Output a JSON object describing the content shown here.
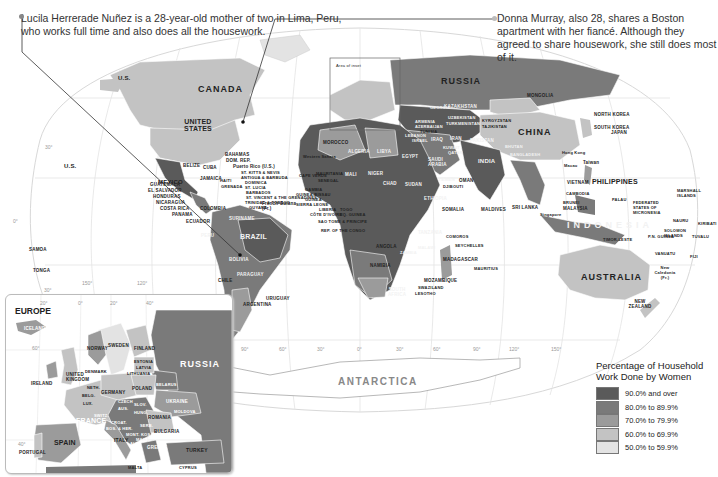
{
  "callouts": {
    "left": "Lucila Herrerade Nuñez is a 28-year-old mother of two in Lima, Peru, who works full time and also does all the housework.",
    "right": "Donna Murray, also 28, shares a Boston apartment with her fiancé. Although they agreed to share housework, she still does most of it."
  },
  "legend": {
    "title": "Percentage of Household Work Done by Women",
    "items": [
      {
        "label": "90.0% and over",
        "color": "#5a5a5a"
      },
      {
        "label": "80.0% to 89.9%",
        "color": "#7a7a7a"
      },
      {
        "label": "70.0% to 79.9%",
        "color": "#9b9b9b"
      },
      {
        "label": "60.0% to 69.9%",
        "color": "#c3c3c3"
      },
      {
        "label": "50.0% to 59.9%",
        "color": "#e3e3e3"
      }
    ]
  },
  "map": {
    "large_labels": {
      "canada": "CANADA",
      "united_states": "UNITED STATES",
      "russia": "RUSSIA",
      "china": "CHINA",
      "brazil": "BRAZIL",
      "australia": "AUSTRALIA",
      "indonesia": "INDONESIA",
      "antarctica": "ANTARCTICA",
      "mexico": "MEXICO",
      "india": "INDIA"
    },
    "small_labels": {
      "us_alaska": "U.S.",
      "us_hawaii": "U.S.",
      "samoa": "SAMOA",
      "tonga": "TONGA",
      "bahamas": "BAHAMAS",
      "dom_rep": "DOM. REP.",
      "puerto_rico": "Puerto Rico (U.S.)",
      "st_kitts": "ST. KITTS & NEVIS",
      "antigua": "ANTIGUA & BARBUDA",
      "dominica": "DOMINICA",
      "st_lucia": "ST. LUCIA",
      "barbados": "BARBADOS",
      "st_vincent": "ST. VINCENT & THE GRENADINES",
      "trinidad": "TRINIDAD & TOBAGO",
      "guyana": "GUYANA",
      "french_guiana": "French Guiana (Fr.)",
      "belize": "BELIZE",
      "cuba": "CUBA",
      "jamaica": "JAMAICA",
      "haiti": "HAITI",
      "grenada": "GRENADA",
      "guatemala": "GUATEMALA",
      "el_salvador": "EL SALVADOR",
      "honduras": "HONDURAS",
      "nicaragua": "NICARAGUA",
      "costa_rica": "COSTA RICA",
      "panama": "PANAMA",
      "colombia": "COLOMBIA",
      "ecuador": "ECUADOR",
      "peru": "PERU",
      "suriname": "SURINAME",
      "bolivia": "BOLIVIA",
      "paraguay": "PARAGUAY",
      "chile": "CHILE",
      "argentina": "ARGENTINA",
      "uruguay": "URUGUAY",
      "morocco": "MOROCCO",
      "western_sahara": "Western Sahara",
      "cape_verde": "CAPE VERDE",
      "mauritania": "MAURITANIA",
      "senegal": "SENEGAL",
      "gambia": "GAMBIA",
      "guinea_bissau": "GUINEA-BISSAU",
      "guinea": "GUINEA",
      "sierra_leone": "SIERRA LEONE",
      "liberia": "LIBERIA",
      "cote_divoire": "CÔTE D'IVOIRE",
      "togo": "TOGO",
      "eq_guinea": "EQ. GUINEA",
      "sao_tome": "SAO TOME & PRINCIPE",
      "rep_congo": "REP. OF THE CONGO",
      "algeria": "ALGERIA",
      "libya": "LIBYA",
      "egypt": "EGYPT",
      "mali": "MALI",
      "niger": "NIGER",
      "chad": "CHAD",
      "sudan": "SUDAN",
      "ethiopia": "ETHIOPIA",
      "djibouti": "DJIBOUTI",
      "somalia": "SOMALIA",
      "tanzania": "TANZANIA",
      "angola": "ANGOLA",
      "zambia": "ZAMBIA",
      "malawi": "MALAWI",
      "namibia": "NAMIBIA",
      "mozambique": "MOZAMBIQUE",
      "swaziland": "SWAZILAND",
      "lesotho": "LESOTHO",
      "south_africa": "SOUTH AFRICA",
      "comoros": "COMOROS",
      "seychelles": "SEYCHELLES",
      "madagascar": "MADAGASCAR",
      "mauritius": "MAURITIUS",
      "tunisia": "TUNISIA",
      "lebanon": "LEBANON",
      "israel": "ISRAEL",
      "georgia": "GEORGIA",
      "armenia": "ARMENIA",
      "azerbaijan": "AZERBAIJAN",
      "kazakhstan": "KAZAKHSTAN",
      "uzbekistan": "UZBEKISTAN",
      "turkmenistan": "TURKMENISTAN",
      "kyrgyzstan": "KYRGYZSTAN",
      "tajikistan": "TAJIKISTAN",
      "iran": "IRAN",
      "iraq": "IRAQ",
      "kuwait": "KUWAIT",
      "qatar": "QATAR",
      "saudi_arabia": "SAUDI ARABIA",
      "oman": "OMAN",
      "yemen": "YEMEN",
      "pakistan": "PAKISTAN",
      "bhutan": "BHUTAN",
      "bangladesh": "BANGLADESH",
      "maldives": "MALDIVES",
      "sri_lanka": "SRI LANKA",
      "mongolia": "MONGOLIA",
      "north_korea": "NORTH KOREA",
      "south_korea": "SOUTH KOREA",
      "japan": "JAPAN",
      "hong_kong": "Hong Kong",
      "macau": "Macau",
      "taiwan": "Taiwan",
      "vietnam": "VIETNAM",
      "cambodia": "CAMBODIA",
      "philippines": "PHILIPPINES",
      "brunei": "BRUNEI",
      "malaysia": "MALAYSIA",
      "singapore": "Singapore",
      "palau": "PALAU",
      "micronesia": "FEDERATED STATES OF MICRONESIA",
      "marshall_islands": "MARSHALL ISLANDS",
      "nauru": "NAURU",
      "kiribati": "KIRIBATI",
      "solomon_islands": "SOLOMON ISLANDS",
      "tuvalu": "TUVALU",
      "papua_new_guinea": "P.N. GUINEA",
      "timor_leste": "TIMOR-LESTE",
      "vanuatu": "VANUATU",
      "fiji": "FIJI",
      "new_caledonia": "New Caledonia (Fr.)",
      "new_zealand": "NEW ZEALAND",
      "area_of_inset": "Area of inset"
    },
    "graticule_labels": [
      "30°",
      "0°",
      "30°",
      "150°",
      "120°",
      "90°",
      "60°",
      "30°",
      "0°",
      "30°",
      "60°",
      "90°",
      "120°",
      "150°"
    ]
  },
  "inset": {
    "title": "EUROPE",
    "labels": {
      "iceland": "ICELAND",
      "norway": "NORWAY",
      "sweden": "SWEDEN",
      "finland": "FINLAND",
      "estonia": "ESTONIA",
      "latvia": "LATVIA",
      "lithuania": "LITHUANIA",
      "russia": "RUSSIA",
      "denmark": "DENMARK",
      "united_kingdom": "UNITED KINGDOM",
      "ireland": "IRELAND",
      "netherlands": "NETH.",
      "belgium": "BELG.",
      "lux": "LUX.",
      "germany": "GERMANY",
      "poland": "POLAND",
      "belarus": "BELARUS",
      "ukraine": "UKRAINE",
      "moldova": "MOLDOVA",
      "czech": "CZECH",
      "slovakia": "SLOV.",
      "austria": "AUS.",
      "hungary": "HUNG.",
      "switzerland": "SWITZ.",
      "romania": "ROMANIA",
      "france": "FRANCE",
      "croatia": "CROAT.",
      "bosnia": "BOS. & HER.",
      "serbia": "SERB.",
      "bulgaria": "BULGARIA",
      "montenegro": "MONT.",
      "kosovo": "KOS.",
      "macedonia": "MACE.",
      "albania": "ALB.",
      "italy": "ITALY",
      "greece": "GREECE",
      "spain": "SPAIN",
      "portugal": "PORTUGAL",
      "turkey": "TURKEY",
      "malta": "MALTA",
      "cyprus": "CYPRUS"
    },
    "graticule_labels": [
      "20°",
      "0°",
      "20°",
      "40°",
      "60°",
      "40°"
    ]
  }
}
